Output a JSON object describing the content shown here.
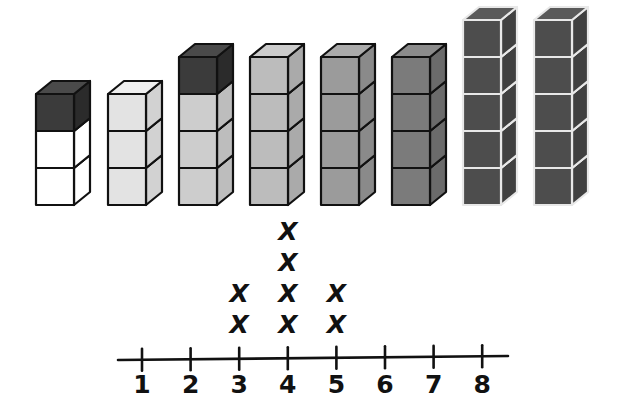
{
  "figure": {
    "title": "",
    "background_color": "#ffffff",
    "ink_color": "#111111"
  },
  "cube_towers": {
    "name": "cube-tower-row",
    "baseline_y": 205,
    "cube_width": 38,
    "cube_body_height": 37,
    "cube_depth_x": 16,
    "cube_depth_y": 13,
    "towers": [
      {
        "index": 1,
        "label": "1",
        "cube_count": 3,
        "left_x": 36,
        "cubes": [
          {
            "position": "top",
            "front": "#3b3b3b",
            "side": "#2b2b2b",
            "top": "#4a4a4a",
            "edge": "#111111"
          },
          {
            "position": "middle",
            "front": "#ffffff",
            "side": "#ffffff",
            "top": "#ffffff",
            "edge": "#111111"
          },
          {
            "position": "bottom",
            "front": "#ffffff",
            "side": "#ffffff",
            "top": "#ffffff",
            "edge": "#111111"
          }
        ]
      },
      {
        "index": 2,
        "label": "2",
        "cube_count": 3,
        "left_x": 108,
        "cubes": [
          {
            "position": "top",
            "front": "#e3e3e3",
            "side": "#d2d2d2",
            "top": "#efefef",
            "edge": "#111111"
          },
          {
            "position": "middle",
            "front": "#e3e3e3",
            "side": "#d2d2d2",
            "top": "#efefef",
            "edge": "#111111"
          },
          {
            "position": "bottom",
            "front": "#e3e3e3",
            "side": "#d2d2d2",
            "top": "#efefef",
            "edge": "#111111"
          }
        ]
      },
      {
        "index": 3,
        "label": "3",
        "cube_count": 4,
        "left_x": 179,
        "cubes": [
          {
            "position": "top",
            "front": "#3b3b3b",
            "side": "#2b2b2b",
            "top": "#4a4a4a",
            "edge": "#111111"
          },
          {
            "position": "upper",
            "front": "#cdcdcd",
            "side": "#bdbdbd",
            "top": "#dcdcdc",
            "edge": "#111111"
          },
          {
            "position": "lower",
            "front": "#cdcdcd",
            "side": "#bdbdbd",
            "top": "#dcdcdc",
            "edge": "#111111"
          },
          {
            "position": "bottom",
            "front": "#cdcdcd",
            "side": "#bdbdbd",
            "top": "#dcdcdc",
            "edge": "#111111"
          }
        ]
      },
      {
        "index": 4,
        "label": "4",
        "cube_count": 4,
        "left_x": 250,
        "cubes": [
          {
            "position": "top",
            "front": "#bcbcbc",
            "side": "#aaaaaa",
            "top": "#cccccc",
            "edge": "#111111"
          },
          {
            "position": "upper",
            "front": "#bcbcbc",
            "side": "#aaaaaa",
            "top": "#cccccc",
            "edge": "#111111"
          },
          {
            "position": "lower",
            "front": "#bcbcbc",
            "side": "#aaaaaa",
            "top": "#cccccc",
            "edge": "#111111"
          },
          {
            "position": "bottom",
            "front": "#bcbcbc",
            "side": "#aaaaaa",
            "top": "#cccccc",
            "edge": "#111111"
          }
        ]
      },
      {
        "index": 5,
        "label": "5",
        "cube_count": 4,
        "left_x": 321,
        "cubes": [
          {
            "position": "top",
            "front": "#9b9b9b",
            "side": "#8a8a8a",
            "top": "#ababab",
            "edge": "#111111"
          },
          {
            "position": "upper",
            "front": "#9b9b9b",
            "side": "#8a8a8a",
            "top": "#ababab",
            "edge": "#111111"
          },
          {
            "position": "lower",
            "front": "#9b9b9b",
            "side": "#8a8a8a",
            "top": "#ababab",
            "edge": "#111111"
          },
          {
            "position": "bottom",
            "front": "#9b9b9b",
            "side": "#8a8a8a",
            "top": "#ababab",
            "edge": "#111111"
          }
        ]
      },
      {
        "index": 6,
        "label": "6",
        "cube_count": 4,
        "left_x": 392,
        "cubes": [
          {
            "position": "top",
            "front": "#7b7b7b",
            "side": "#6b6b6b",
            "top": "#8b8b8b",
            "edge": "#111111"
          },
          {
            "position": "upper",
            "front": "#7b7b7b",
            "side": "#6b6b6b",
            "top": "#8b8b8b",
            "edge": "#111111"
          },
          {
            "position": "lower",
            "front": "#7b7b7b",
            "side": "#6b6b6b",
            "top": "#8b8b8b",
            "edge": "#111111"
          },
          {
            "position": "bottom",
            "front": "#7b7b7b",
            "side": "#6b6b6b",
            "top": "#8b8b8b",
            "edge": "#111111"
          }
        ]
      },
      {
        "index": 7,
        "label": "7",
        "cube_count": 5,
        "left_x": 463,
        "cubes": [
          {
            "position": "top",
            "front": "#4d4d4d",
            "side": "#404040",
            "top": "#5a5a5a",
            "edge": "#e8e8e8"
          },
          {
            "position": "second",
            "front": "#4d4d4d",
            "side": "#404040",
            "top": "#5a5a5a",
            "edge": "#e8e8e8"
          },
          {
            "position": "third",
            "front": "#4d4d4d",
            "side": "#404040",
            "top": "#5a5a5a",
            "edge": "#e8e8e8"
          },
          {
            "position": "fourth",
            "front": "#4d4d4d",
            "side": "#404040",
            "top": "#5a5a5a",
            "edge": "#e8e8e8"
          },
          {
            "position": "bottom",
            "front": "#4d4d4d",
            "side": "#404040",
            "top": "#5a5a5a",
            "edge": "#e8e8e8"
          }
        ]
      },
      {
        "index": 8,
        "label": "8",
        "cube_count": 5,
        "left_x": 534,
        "cubes": [
          {
            "position": "top",
            "front": "#4d4d4d",
            "side": "#404040",
            "top": "#5a5a5a",
            "edge": "#e8e8e8"
          },
          {
            "position": "second",
            "front": "#4d4d4d",
            "side": "#404040",
            "top": "#5a5a5a",
            "edge": "#e8e8e8"
          },
          {
            "position": "third",
            "front": "#4d4d4d",
            "side": "#404040",
            "top": "#5a5a5a",
            "edge": "#e8e8e8"
          },
          {
            "position": "fourth",
            "front": "#4d4d4d",
            "side": "#404040",
            "top": "#5a5a5a",
            "edge": "#e8e8e8"
          },
          {
            "position": "bottom",
            "front": "#4d4d4d",
            "side": "#404040",
            "top": "#5a5a5a",
            "edge": "#e8e8e8"
          }
        ]
      }
    ]
  },
  "number_line": {
    "name": "number-line",
    "axis_y": 358,
    "axis_start_x": 118,
    "axis_end_x": 508,
    "tick_half_height": 11,
    "tick_spacing": 48.6,
    "first_tick_x": 142,
    "label_y": 393,
    "ticks": [
      {
        "value": 1,
        "label": "1",
        "x": 142
      },
      {
        "value": 2,
        "label": "2",
        "x": 190.6
      },
      {
        "value": 3,
        "label": "3",
        "x": 239.2
      },
      {
        "value": 4,
        "label": "4",
        "x": 287.8
      },
      {
        "value": 5,
        "label": "5",
        "x": 336.4
      },
      {
        "value": 6,
        "label": "6",
        "x": 385
      },
      {
        "value": 7,
        "label": "7",
        "x": 433.6
      },
      {
        "value": 8,
        "label": "8",
        "x": 482.2
      }
    ]
  },
  "chart_data": {
    "type": "dotplot",
    "title": "",
    "xlabel": "",
    "ylabel": "",
    "mark_glyph": "X",
    "categories": [
      "1",
      "2",
      "3",
      "4",
      "5",
      "6",
      "7",
      "8"
    ],
    "values": [
      0,
      0,
      2,
      4,
      2,
      0,
      0,
      0
    ],
    "xlim": [
      1,
      8
    ],
    "grid": false,
    "legend": null,
    "stack_row_height": 31,
    "first_row_offset": 25,
    "annotations": []
  }
}
